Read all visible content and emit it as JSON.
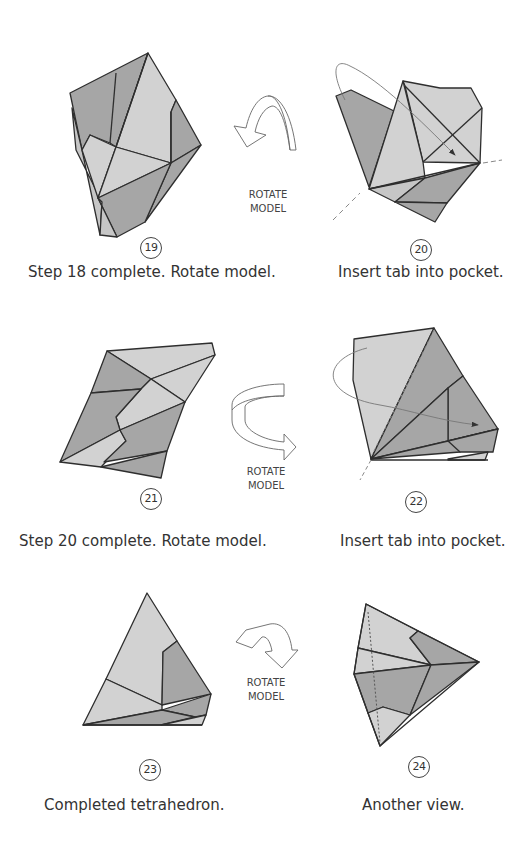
{
  "page": {
    "colors": {
      "light_face": "#d2d2d2",
      "dark_face": "#a6a6a6",
      "mid_face": "#bcbcbc",
      "line": "#2e2e2e",
      "arrow": "#777777"
    }
  },
  "steps": [
    {
      "number": "19",
      "caption": "Step 18 complete. Rotate model."
    },
    {
      "number": "20",
      "caption": "Insert tab into pocket."
    },
    {
      "number": "21",
      "caption": "Step 20 complete. Rotate model."
    },
    {
      "number": "22",
      "caption": "Insert tab into pocket."
    },
    {
      "number": "23",
      "caption": "Completed tetrahedron."
    },
    {
      "number": "24",
      "caption": "Another view."
    }
  ],
  "rotate_symbols": [
    {
      "line1": "ROTATE",
      "line2": "MODEL",
      "direction": "curl-down-left"
    },
    {
      "line1": "ROTATE",
      "line2": "MODEL",
      "direction": "around-right"
    },
    {
      "line1": "ROTATE",
      "line2": "MODEL",
      "direction": "flip-down"
    }
  ]
}
